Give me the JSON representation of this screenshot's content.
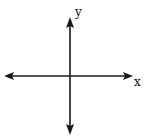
{
  "diagram": {
    "type": "coordinate-axes",
    "x_axis": {
      "label": "x",
      "direction": "bidirectional",
      "y_position": 76,
      "x_start": 5,
      "x_end": 132
    },
    "y_axis": {
      "label": "y",
      "direction": "bidirectional",
      "x_position": 70,
      "y_start": 18,
      "y_end": 134
    },
    "origin": {
      "x": 70,
      "y": 76
    },
    "stroke_color": "#1a1a1a",
    "background_color": "#ffffff"
  }
}
